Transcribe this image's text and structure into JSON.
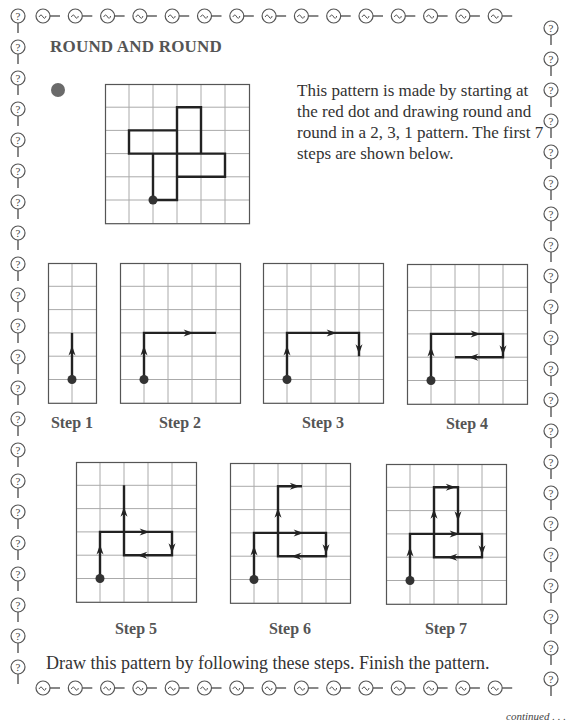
{
  "page": {
    "title": "ROUND AND ROUND",
    "intro": "This pattern is made by starting at the red dot and drawing round and round in a 2, 3, 1 pattern. The first 7 steps are shown below.",
    "instruction": "Draw this pattern by following these steps. Finish the pattern.",
    "continued": "continued . . .",
    "red_dot_color": "#6a6a6a",
    "border_icons": {
      "horizontal": "coin-link-icon",
      "vertical": "question-key-icon"
    }
  },
  "main_figure": {
    "cols": 6,
    "rows": 6,
    "start": [
      2,
      5
    ],
    "path": [
      [
        2,
        5
      ],
      [
        2,
        3
      ],
      [
        5,
        3
      ],
      [
        5,
        4
      ],
      [
        3,
        4
      ],
      [
        3,
        1
      ],
      [
        4,
        1
      ],
      [
        4,
        3
      ],
      [
        1,
        3
      ],
      [
        1,
        2
      ],
      [
        3,
        2
      ],
      [
        3,
        5
      ],
      [
        2,
        5
      ]
    ]
  },
  "steps": [
    {
      "label": "Step 1",
      "cols": 2,
      "rows": 6,
      "start": [
        1,
        5
      ],
      "path": [
        [
          1,
          5
        ],
        [
          1,
          3
        ]
      ]
    },
    {
      "label": "Step 2",
      "cols": 5,
      "rows": 6,
      "start": [
        1,
        5
      ],
      "path": [
        [
          1,
          5
        ],
        [
          1,
          3
        ],
        [
          4,
          3
        ]
      ]
    },
    {
      "label": "Step 3",
      "cols": 5,
      "rows": 6,
      "start": [
        1,
        5
      ],
      "path": [
        [
          1,
          5
        ],
        [
          1,
          3
        ],
        [
          4,
          3
        ],
        [
          4,
          4
        ]
      ]
    },
    {
      "label": "Step 4",
      "cols": 5,
      "rows": 6,
      "start": [
        1,
        5
      ],
      "path": [
        [
          1,
          5
        ],
        [
          1,
          3
        ],
        [
          4,
          3
        ],
        [
          4,
          4
        ],
        [
          2,
          4
        ]
      ]
    },
    {
      "label": "Step 5",
      "cols": 5,
      "rows": 6,
      "start": [
        1,
        5
      ],
      "path": [
        [
          1,
          5
        ],
        [
          1,
          3
        ],
        [
          4,
          3
        ],
        [
          4,
          4
        ],
        [
          2,
          4
        ],
        [
          2,
          1
        ]
      ]
    },
    {
      "label": "Step 6",
      "cols": 5,
      "rows": 6,
      "start": [
        1,
        5
      ],
      "path": [
        [
          1,
          5
        ],
        [
          1,
          3
        ],
        [
          4,
          3
        ],
        [
          4,
          4
        ],
        [
          2,
          4
        ],
        [
          2,
          1
        ],
        [
          3,
          1
        ]
      ]
    },
    {
      "label": "Step 7",
      "cols": 5,
      "rows": 6,
      "start": [
        1,
        5
      ],
      "path": [
        [
          1,
          5
        ],
        [
          1,
          3
        ],
        [
          4,
          3
        ],
        [
          4,
          4
        ],
        [
          2,
          4
        ],
        [
          2,
          1
        ],
        [
          3,
          1
        ],
        [
          3,
          3
        ]
      ]
    }
  ]
}
